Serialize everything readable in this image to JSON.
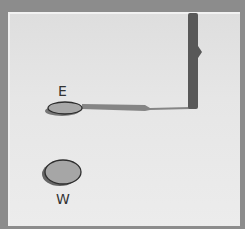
{
  "diagram": {
    "labels": {
      "east": "E",
      "west": "W"
    },
    "colors": {
      "frame": "#8c8c8c",
      "panel": "#e6e6e6",
      "stick": "#555555",
      "shadow": "#777777",
      "stone_fill": "#a9a9a9",
      "stone_outline": "#333333"
    }
  }
}
